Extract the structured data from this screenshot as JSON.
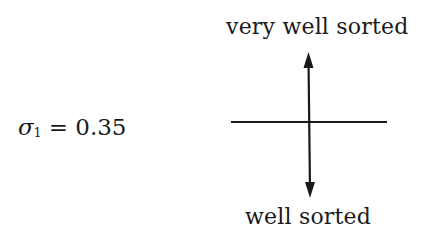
{
  "diagram": {
    "top_label": "very well sorted",
    "bottom_label": "well sorted",
    "equation": {
      "symbol": "σ",
      "subscript": "1",
      "operator": "=",
      "value": "0.35"
    },
    "axes": {
      "horizontal_line": {
        "x1": 231,
        "x2": 387,
        "y": 122
      },
      "vertical_arrow": {
        "x": 309,
        "y_top": 52,
        "y_bottom": 198,
        "arrowheads": [
          "up",
          "down"
        ]
      }
    },
    "colors": {
      "ink": "#1a1a1a",
      "background": "#ffffff"
    }
  }
}
